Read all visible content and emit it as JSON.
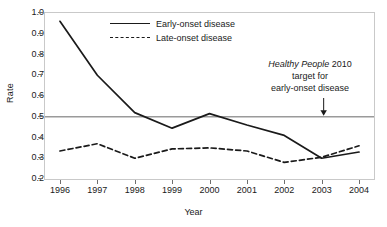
{
  "chart_data": {
    "type": "line",
    "title": "",
    "xlabel": "Year",
    "ylabel": "Rate",
    "categories": [
      "1996",
      "1997",
      "1998",
      "1999",
      "2000",
      "2001",
      "2002",
      "2003",
      "2004"
    ],
    "x": [
      1996,
      1997,
      1998,
      1999,
      2000,
      2001,
      2002,
      2003,
      2004
    ],
    "xlim": [
      1995.6,
      2004.4
    ],
    "ylim": [
      0.2,
      1.0
    ],
    "yticks": [
      0.2,
      0.3,
      0.4,
      0.5,
      0.6,
      0.7,
      0.8,
      0.9,
      1.0
    ],
    "ytick_labels": [
      "0.2",
      "0.3",
      "0.4",
      "0.5",
      "0.6",
      "0.7",
      "0.8",
      "0.9",
      "1.0"
    ],
    "grid": false,
    "legend_position": "top-center",
    "series": [
      {
        "name": "Early-onset disease",
        "style": "solid",
        "color": "#1a1a1a",
        "values": [
          0.96,
          0.7,
          0.52,
          0.445,
          0.515,
          0.46,
          0.41,
          0.3,
          0.33
        ]
      },
      {
        "name": "Late-onset disease",
        "style": "dashed",
        "color": "#1a1a1a",
        "values": [
          0.335,
          0.37,
          0.3,
          0.345,
          0.35,
          0.335,
          0.28,
          0.305,
          0.36
        ]
      }
    ],
    "reference_line": {
      "value": 0.5,
      "color": "#9a9a9a",
      "label": "Healthy People 2010 target for early-onset disease"
    },
    "annotations": [
      {
        "name": "healthy-people-target",
        "line1_italic": "Healthy  People",
        "line1_rest": " 2010",
        "line2": "target for",
        "line3": "early-onset disease",
        "arrow": "down-arrow",
        "points_to_year": 2003,
        "points_to_value": 0.5
      }
    ]
  },
  "legend": {
    "items": [
      {
        "label": "Early-onset disease",
        "style": "solid"
      },
      {
        "label": "Late-onset disease",
        "style": "dashed"
      }
    ]
  },
  "axes": {
    "y_title": "Rate",
    "x_title": "Year"
  }
}
